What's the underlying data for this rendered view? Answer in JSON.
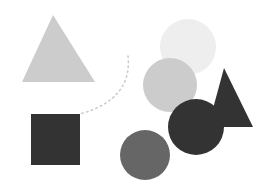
{
  "canvas": {
    "width": 267,
    "height": 196,
    "background_color": "#ffffff",
    "title": "Abstract grayscale geometric shape composition"
  },
  "palette": {
    "lightest_gray": "#eeeeee",
    "light_gray": "#cccccc",
    "medium_gray": "#666666",
    "dark_charcoal": "#333333",
    "connector_gray": "#cccccc",
    "background": "#ffffff"
  },
  "shapes": [
    {
      "id": "triangle-light-left",
      "name": "light-gray-triangle",
      "type": "triangle",
      "fill": "#cccccc",
      "apex_x": 53,
      "apex_y": 15,
      "base_left_x": 22,
      "base_right_x": 95,
      "base_y": 82,
      "z_order": 1
    },
    {
      "id": "square-dark-left",
      "name": "dark-square",
      "type": "rect",
      "fill": "#333333",
      "x": 31,
      "y": 114,
      "width": 49,
      "height": 51,
      "z_order": 2
    },
    {
      "id": "circle-lightest-top",
      "name": "lightest-gray-circle",
      "type": "circle",
      "fill": "#eeeeee",
      "cx": 188,
      "cy": 47,
      "r": 28,
      "z_order": 3
    },
    {
      "id": "circle-light-middle",
      "name": "light-gray-circle",
      "type": "circle",
      "fill": "#cccccc",
      "cx": 170,
      "cy": 85,
      "r": 27,
      "z_order": 4
    },
    {
      "id": "triangle-dark-right",
      "name": "dark-triangle",
      "type": "triangle",
      "fill": "#333333",
      "apex_x": 224,
      "apex_y": 68,
      "base_left_x": 208,
      "base_right_x": 253,
      "base_y": 127,
      "z_order": 5
    },
    {
      "id": "circle-medium-bottom",
      "name": "medium-gray-circle",
      "type": "circle",
      "fill": "#666666",
      "cx": 145,
      "cy": 155,
      "r": 25,
      "z_order": 6
    },
    {
      "id": "circle-dark-right",
      "name": "dark-circle",
      "type": "circle",
      "fill": "#333333",
      "cx": 196,
      "cy": 127,
      "r": 28,
      "z_order": 7
    }
  ],
  "connector": {
    "id": "dotted-curve",
    "name": "dotted-connector-curve",
    "type": "dotted-bezier",
    "stroke": "#cccccc",
    "stroke_width": 1.6,
    "dash_pattern": "1.5 3.5",
    "linecap": "round",
    "path": "M 128 56 C 131 84, 116 104, 80 114",
    "start_x": 128,
    "start_y": 56,
    "end_x": 80,
    "end_y": 114,
    "z_order": 8
  }
}
